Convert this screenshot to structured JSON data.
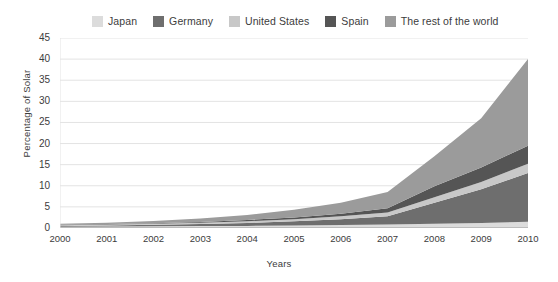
{
  "chart_data": {
    "type": "area",
    "stacked": true,
    "title": "",
    "xlabel": "Years",
    "ylabel": "Percentage of Solar",
    "x": [
      2000,
      2001,
      2002,
      2003,
      2004,
      2005,
      2006,
      2007,
      2008,
      2009,
      2010
    ],
    "categories": [
      "2000",
      "2001",
      "2002",
      "2003",
      "2004",
      "2005",
      "2006",
      "2007",
      "2008",
      "2009",
      "2010"
    ],
    "xlim": [
      2000,
      2010
    ],
    "ylim": [
      0,
      45
    ],
    "yticks": [
      0,
      5,
      10,
      15,
      20,
      25,
      30,
      35,
      40,
      45
    ],
    "ytick_labels": [
      "0",
      "5",
      "10",
      "15",
      "20",
      "25",
      "30",
      "35",
      "40",
      "45"
    ],
    "grid": "horizontal",
    "legend_position": "top",
    "series": [
      {
        "name": "Japan",
        "color": "#dcdcdc",
        "values": [
          0.3,
          0.35,
          0.4,
          0.45,
          0.5,
          0.6,
          0.7,
          0.8,
          1.0,
          1.2,
          1.5
        ]
      },
      {
        "name": "Germany",
        "color": "#6e6e6e",
        "values": [
          0.2,
          0.25,
          0.35,
          0.5,
          0.7,
          1.0,
          1.4,
          2.0,
          5.0,
          8.0,
          11.5
        ]
      },
      {
        "name": "United States",
        "color": "#c8c8c8",
        "values": [
          0.15,
          0.2,
          0.25,
          0.3,
          0.4,
          0.5,
          0.7,
          0.9,
          1.3,
          1.7,
          2.2
        ]
      },
      {
        "name": "Spain",
        "color": "#555555",
        "values": [
          0.1,
          0.12,
          0.15,
          0.2,
          0.3,
          0.4,
          0.6,
          1.0,
          2.6,
          3.4,
          4.3
        ]
      },
      {
        "name": "The rest of the world",
        "color": "#9b9b9b",
        "values": [
          0.25,
          0.35,
          0.5,
          0.8,
          1.2,
          1.8,
          2.6,
          3.8,
          7.1,
          11.7,
          20.5
        ]
      }
    ],
    "totals": [
      1.0,
      1.27,
      1.65,
      2.25,
      3.1,
      4.3,
      6.0,
      8.5,
      17.0,
      26.0,
      40.0
    ]
  },
  "legend": {
    "items": [
      {
        "label": "Japan",
        "color": "#dcdcdc"
      },
      {
        "label": "Germany",
        "color": "#6e6e6e"
      },
      {
        "label": "United States",
        "color": "#c8c8c8"
      },
      {
        "label": "Spain",
        "color": "#555555"
      },
      {
        "label": "The rest of the world",
        "color": "#9b9b9b"
      }
    ]
  },
  "axes": {
    "y_title": "Percentage of Solar",
    "x_title": "Years"
  },
  "style": {
    "background": "#ffffff",
    "grid_color": "#e3e3e3",
    "axis_color": "#9a9a9a",
    "text_color": "#3c3c3c"
  }
}
